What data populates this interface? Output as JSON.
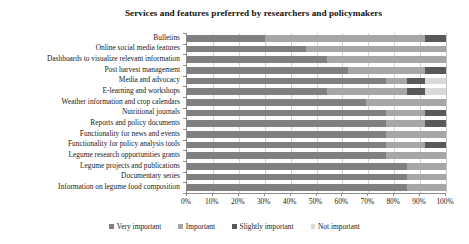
{
  "chart_data": {
    "type": "bar",
    "subtype": "horizontal-stacked-100",
    "title": "Services and features preferred by researchers and policymakers",
    "xlabel": "",
    "ylabel": "",
    "xlim": [
      0,
      100
    ],
    "xticks": [
      "0%",
      "10%",
      "20%",
      "30%",
      "40%",
      "50%",
      "60%",
      "70%",
      "80%",
      "90%",
      "100%"
    ],
    "xtick_values": [
      0,
      10,
      20,
      30,
      40,
      50,
      60,
      70,
      80,
      90,
      100
    ],
    "grid": true,
    "grid_axis": "x",
    "legend_position": "bottom",
    "categories": [
      "Bulletins",
      "Online social media features",
      "Dashboards to visualize relevant information",
      "Post harvest management",
      "Media and advocacy",
      "E-learning and workshops",
      "Weather information and crop calendars",
      "Nutritional journals",
      "Reports and policy documents",
      "Functionality for news and events",
      "Functionality for policy analysis tools",
      "Legume research opportunities grants",
      "Legume projects and publications",
      "Documentary series",
      "Information on legume food composition"
    ],
    "series": [
      {
        "name": "Very important",
        "color": "#808080",
        "values": [
          30,
          46,
          54,
          62,
          77,
          54,
          69,
          77,
          77,
          77,
          77,
          77,
          85,
          85,
          85
        ]
      },
      {
        "name": "Important",
        "color": "#a6a6a6",
        "values": [
          62,
          54,
          46,
          30,
          8,
          31,
          31,
          15,
          15,
          23,
          15,
          23,
          15,
          15,
          15
        ]
      },
      {
        "name": "Slightly important",
        "color": "#595959",
        "values": [
          8,
          0,
          0,
          8,
          7,
          7,
          0,
          8,
          8,
          0,
          8,
          0,
          0,
          0,
          0
        ]
      },
      {
        "name": "Not important",
        "color": "#d9d9d9",
        "values": [
          0,
          0,
          0,
          0,
          8,
          8,
          0,
          0,
          0,
          0,
          0,
          0,
          0,
          0,
          0
        ]
      }
    ]
  },
  "colors": {
    "axis": "#8c8c8c",
    "grid": "#d4d4d4",
    "text": "#1a1a1a",
    "background": "#ffffff"
  }
}
